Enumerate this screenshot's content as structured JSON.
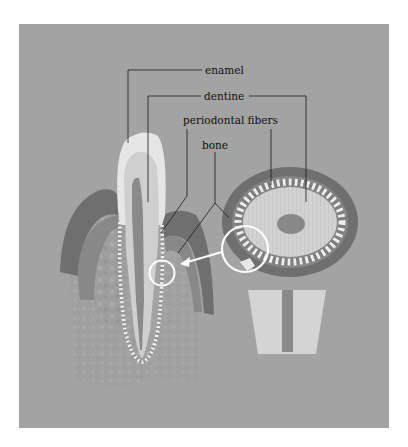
{
  "diagram": {
    "colors": {
      "page_background": "#ffffff",
      "panel_background": "#a3a3a3",
      "enamel": "#e6e6e6",
      "dentine": "#cfcfcf",
      "pulp": "#8a8a8a",
      "gum_dark": "#6e6e6e",
      "gum_mid": "#858585",
      "bone": "#9c9c9c",
      "periodontal_fibers": "#efefef",
      "highlight_circle": "#ffffff",
      "label_text": "#111111",
      "leader_lines": "#1a1a1a"
    },
    "labels": [
      {
        "id": "enamel",
        "text": "enamel"
      },
      {
        "id": "dentine",
        "text": "dentine"
      },
      {
        "id": "periodontal-fibers",
        "text": "periodontal fibers"
      },
      {
        "id": "bone",
        "text": "bone"
      }
    ],
    "panels": {
      "left": "longitudinal section of tooth in jaw",
      "right": "cross section of tooth root"
    },
    "callout": {
      "description": "magnified circle on cross section with arrow pointing to corresponding region on longitudinal section"
    }
  }
}
